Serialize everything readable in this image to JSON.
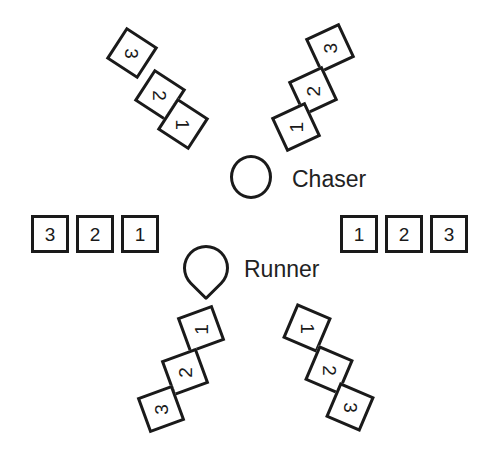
{
  "figure": {
    "background_color": "#ffffff",
    "stroke_color": "#1a1a1a",
    "width": 493,
    "height": 471
  },
  "center": {
    "chaser": {
      "shape": "circle",
      "label": "Chaser",
      "cx": 251,
      "cy": 177,
      "label_x": 292,
      "label_y": 166
    },
    "runner": {
      "shape": "dome",
      "label": "Runner",
      "cx": 206,
      "cy": 268,
      "label_x": 244,
      "label_y": 256
    }
  },
  "arms": [
    {
      "id": "upper-left",
      "name": "upper-left-arm",
      "rotation": 33,
      "order": "outer-to-inner",
      "cells": [
        {
          "label": "3",
          "x": 113,
          "y": 34,
          "rotation": 33
        },
        {
          "label": "2",
          "x": 141,
          "y": 76,
          "rotation": 33
        },
        {
          "label": "1",
          "x": 164,
          "y": 105,
          "rotation": 33
        }
      ]
    },
    {
      "id": "upper-right",
      "name": "upper-right-arm",
      "rotation": -25,
      "order": "outer-to-inner",
      "cells": [
        {
          "label": "3",
          "x": 311,
          "y": 29,
          "rotation": -25
        },
        {
          "label": "2",
          "x": 294,
          "y": 72,
          "rotation": -25
        },
        {
          "label": "1",
          "x": 277,
          "y": 108,
          "rotation": -25
        }
      ]
    },
    {
      "id": "left",
      "name": "left-row",
      "rotation": 0,
      "order": "outer-to-inner",
      "cells": [
        {
          "label": "3",
          "x": 31,
          "y": 215,
          "rotation": 0
        },
        {
          "label": "2",
          "x": 76,
          "y": 215,
          "rotation": 0
        },
        {
          "label": "1",
          "x": 121,
          "y": 215,
          "rotation": 0
        }
      ]
    },
    {
      "id": "right",
      "name": "right-row",
      "rotation": 0,
      "order": "inner-to-outer",
      "cells": [
        {
          "label": "1",
          "x": 340,
          "y": 215,
          "rotation": 0
        },
        {
          "label": "2",
          "x": 385,
          "y": 215,
          "rotation": 0
        },
        {
          "label": "3",
          "x": 430,
          "y": 215,
          "rotation": 0
        }
      ]
    },
    {
      "id": "lower-left",
      "name": "lower-left-arm",
      "rotation": -20,
      "order": "inner-to-outer",
      "cells": [
        {
          "label": "1",
          "x": 182,
          "y": 310,
          "rotation": -20
        },
        {
          "label": "2",
          "x": 166,
          "y": 353,
          "rotation": -20
        },
        {
          "label": "3",
          "x": 142,
          "y": 390,
          "rotation": -20
        }
      ]
    },
    {
      "id": "lower-right",
      "name": "lower-right-arm",
      "rotation": 23,
      "order": "inner-to-outer",
      "cells": [
        {
          "label": "1",
          "x": 288,
          "y": 309,
          "rotation": 23
        },
        {
          "label": "2",
          "x": 310,
          "y": 351,
          "rotation": 23
        },
        {
          "label": "3",
          "x": 331,
          "y": 388,
          "rotation": 23
        }
      ]
    }
  ]
}
